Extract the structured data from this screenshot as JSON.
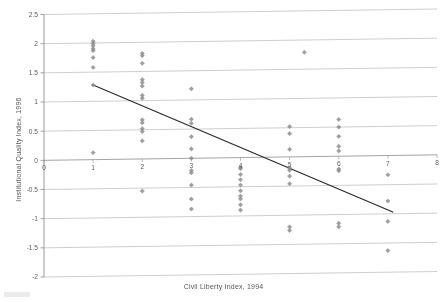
{
  "chart_data": {
    "type": "scatter",
    "title": "",
    "xlabel": "Civil Liberty Index, 1994",
    "ylabel": "Institutional Quality Index, 1996",
    "xlim": [
      0,
      8
    ],
    "ylim": [
      -2,
      2.5
    ],
    "xticks": [
      "0",
      "1",
      "2",
      "3",
      "4",
      "5",
      "6",
      "7",
      "8"
    ],
    "yticks": [
      "2.5",
      "2",
      "1.5",
      "1",
      "0.5",
      "0",
      "-0.5",
      "-1",
      "-1.5",
      "-2"
    ],
    "grid": "horizontal",
    "legend": "none",
    "marker": "diamond",
    "marker_color": "#8c8c8c",
    "trendline_color": "#2b2b2b",
    "gridline_color": "#b9b9b9",
    "series": [
      {
        "name": "countries",
        "points": [
          [
            1.0,
            2.03
          ],
          [
            1.0,
            1.99
          ],
          [
            1.0,
            1.95
          ],
          [
            1.0,
            1.9
          ],
          [
            1.0,
            1.87
          ],
          [
            1.0,
            1.75
          ],
          [
            1.0,
            1.58
          ],
          [
            1.0,
            1.28
          ],
          [
            1.0,
            0.12
          ],
          [
            2.0,
            1.81
          ],
          [
            2.0,
            1.77
          ],
          [
            2.0,
            1.64
          ],
          [
            2.0,
            1.36
          ],
          [
            2.0,
            1.31
          ],
          [
            2.0,
            1.25
          ],
          [
            2.0,
            1.09
          ],
          [
            2.0,
            1.04
          ],
          [
            2.0,
            0.67
          ],
          [
            2.0,
            0.62
          ],
          [
            2.0,
            0.52
          ],
          [
            2.0,
            0.47
          ],
          [
            2.0,
            0.31
          ],
          [
            2.0,
            -0.55
          ],
          [
            3.0,
            1.19
          ],
          [
            3.0,
            0.67
          ],
          [
            3.0,
            0.6
          ],
          [
            3.0,
            0.37
          ],
          [
            3.0,
            0.16
          ],
          [
            3.0,
            0.0
          ],
          [
            3.0,
            -0.21
          ],
          [
            3.0,
            -0.25
          ],
          [
            3.0,
            -0.46
          ],
          [
            3.0,
            -0.7
          ],
          [
            3.0,
            -0.87
          ],
          [
            4.0,
            -0.17
          ],
          [
            4.0,
            -0.19
          ],
          [
            4.0,
            -0.29
          ],
          [
            4.0,
            -0.38
          ],
          [
            4.0,
            -0.47
          ],
          [
            4.0,
            -0.57
          ],
          [
            4.0,
            -0.66
          ],
          [
            4.0,
            -0.71
          ],
          [
            4.0,
            -0.81
          ],
          [
            4.0,
            -0.9
          ],
          [
            5.3,
            1.79
          ],
          [
            5.0,
            0.52
          ],
          [
            5.0,
            0.4
          ],
          [
            5.0,
            0.13
          ],
          [
            5.0,
            -0.19
          ],
          [
            5.0,
            -0.23
          ],
          [
            5.0,
            -0.33
          ],
          [
            5.0,
            -0.46
          ],
          [
            5.0,
            -1.2
          ],
          [
            5.0,
            -1.26
          ],
          [
            6.0,
            0.63
          ],
          [
            6.0,
            0.5
          ],
          [
            6.0,
            0.34
          ],
          [
            6.0,
            0.17
          ],
          [
            6.0,
            0.09
          ],
          [
            6.0,
            -0.22
          ],
          [
            6.0,
            -0.25
          ],
          [
            6.0,
            -1.15
          ],
          [
            6.0,
            -1.21
          ],
          [
            7.0,
            -0.33
          ],
          [
            7.0,
            -0.78
          ],
          [
            7.0,
            -1.13
          ],
          [
            7.0,
            -1.63
          ]
        ]
      }
    ],
    "trendline": {
      "x_start": 1.0,
      "y_start": 1.28,
      "x_end": 7.1,
      "y_end": -0.97
    }
  },
  "axis": {
    "x_title": "Civil Liberty Index, 1994",
    "y_title": "Institutional Quality Index, 1996"
  }
}
